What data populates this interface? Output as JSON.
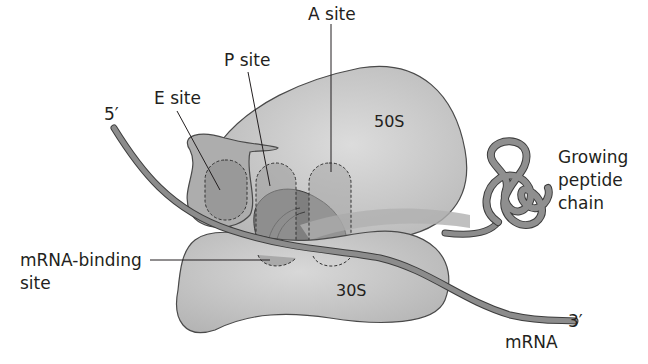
{
  "diagram": {
    "labels": {
      "a_site": "A site",
      "p_site": "P site",
      "e_site": "E site",
      "five_prime": "5′",
      "three_prime": "3′",
      "large_subunit": "50S",
      "small_subunit": "30S",
      "mrna_binding_line1": "mRNA-binding",
      "mrna_binding_line2": "site",
      "peptide_line1": "Growing",
      "peptide_line2": "peptide",
      "peptide_line3": "chain",
      "mrna": "mRNA"
    },
    "colors": {
      "subunit_fill": "#c4c4c4",
      "subunit_highlight": "#dcdcdc",
      "subunit_stroke": "#4a4a4a",
      "site_fill": "#9a9a9a",
      "strand_fill": "#8c8c8c",
      "strand_stroke": "#3d3d3d",
      "text": "#231f20"
    }
  }
}
